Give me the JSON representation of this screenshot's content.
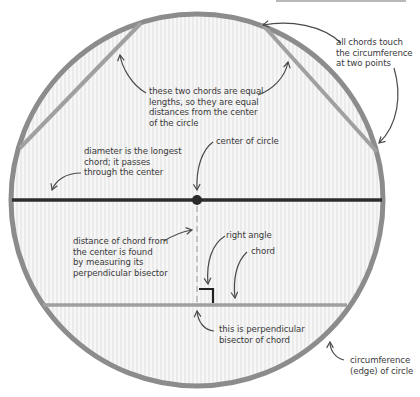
{
  "diagram": {
    "colors": {
      "circumference": "#8c8c8c",
      "chord": "#a0a0a0",
      "diameter": "#2e2e2e",
      "center_dot": "#2a2a2a",
      "fill": "#f6f6f6",
      "stripe": "#ececec",
      "arrow": "#4a4a4a",
      "text": "#3a3a3a",
      "dashed_bisector": "#c4c4c4",
      "right_angle": "#222222"
    },
    "circle": {
      "cx": 197,
      "cy": 200,
      "r": 186
    },
    "labels": {
      "equal_chords": [
        "these two chords are equal",
        "lengths, so they are equal",
        "distances from the center",
        "of the circle"
      ],
      "all_chords": [
        "all chords touch",
        "the circumference",
        "at two points"
      ],
      "diameter": [
        "diameter is the longest",
        "chord; it passes",
        "through the center"
      ],
      "center": [
        "center of circle"
      ],
      "distance": [
        "distance of chord from",
        "the center is found",
        "by measuring its",
        "perpendicular bisector"
      ],
      "right_angle": [
        "right angle"
      ],
      "chord": [
        "chord"
      ],
      "bisector": [
        "this is perpendicular",
        "bisector of chord"
      ],
      "circumference": [
        "circumference",
        "(edge) of circle"
      ]
    }
  }
}
